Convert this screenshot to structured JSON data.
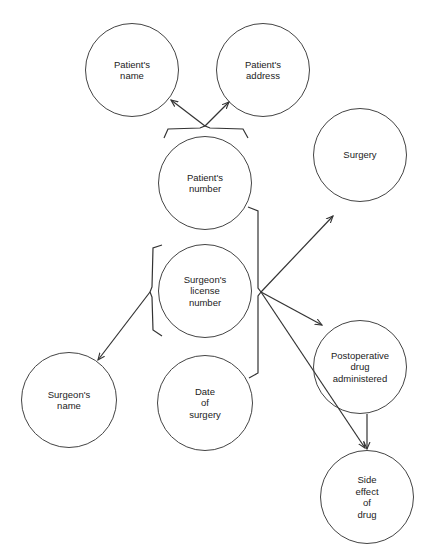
{
  "diagram": {
    "nodes": [
      {
        "id": "patients-name",
        "label": "Patient's\nname",
        "cx": 132,
        "cy": 70,
        "r": 47
      },
      {
        "id": "patients-address",
        "label": "Patient's\naddress",
        "cx": 263,
        "cy": 70,
        "r": 47
      },
      {
        "id": "patients-number",
        "label": "Patient's\nnumber",
        "cx": 205,
        "cy": 183,
        "r": 47
      },
      {
        "id": "surgery",
        "label": "Surgery",
        "cx": 360,
        "cy": 155,
        "r": 47
      },
      {
        "id": "surgeons-license-number",
        "label": "Surgeon's\nlicense\nnumber",
        "cx": 205,
        "cy": 291,
        "r": 47
      },
      {
        "id": "postoperative-drug-administered",
        "label": "Postoperative\ndrug\nadministered",
        "cx": 360,
        "cy": 367,
        "r": 47
      },
      {
        "id": "surgeons-name",
        "label": "Surgeon's\nname",
        "cx": 69,
        "cy": 400,
        "r": 48
      },
      {
        "id": "date-of-surgery",
        "label": "Date\nof\nsurgery",
        "cx": 205,
        "cy": 403,
        "r": 48
      },
      {
        "id": "side-effect-of-drug",
        "label": "Side\neffect\nof\ndrug",
        "cx": 367,
        "cy": 497,
        "r": 47
      }
    ],
    "edges": [
      {
        "from": "patients-number",
        "to": "patients-name",
        "type": "determines"
      },
      {
        "from": "patients-number",
        "to": "patients-address",
        "type": "determines"
      },
      {
        "from": "surgeons-license-number",
        "to": "surgeons-name",
        "type": "determines"
      },
      {
        "from": "patients-number+surgeons-license-number+date-of-surgery",
        "to": "surgery",
        "type": "determines"
      },
      {
        "from": "patients-number+surgeons-license-number+date-of-surgery",
        "to": "postoperative-drug-administered",
        "type": "determines"
      },
      {
        "from": "patients-number+surgeons-license-number+date-of-surgery",
        "to": "side-effect-of-drug",
        "type": "determines"
      },
      {
        "from": "postoperative-drug-administered",
        "to": "side-effect-of-drug",
        "type": "determines"
      }
    ],
    "colors": {
      "stroke": "#333333",
      "background": "#ffffff",
      "text": "#222222"
    }
  }
}
